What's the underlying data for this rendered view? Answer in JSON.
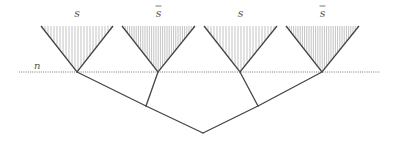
{
  "diagram": {
    "level_label": "n",
    "colors": {
      "edge": "#444444",
      "hatch": "#9a9a9a",
      "dotted": "#777777",
      "label": "#555555"
    },
    "cones": [
      {
        "label": "s",
        "bar": false,
        "apex": [
          77,
          72
        ],
        "left": [
          41,
          26
        ],
        "right": [
          113,
          26
        ]
      },
      {
        "label": "s",
        "bar": true,
        "apex": [
          158,
          72
        ],
        "left": [
          122,
          26
        ],
        "right": [
          195,
          26
        ]
      },
      {
        "label": "s",
        "bar": false,
        "apex": [
          240,
          72
        ],
        "left": [
          204,
          26
        ],
        "right": [
          277,
          26
        ]
      },
      {
        "label": "s",
        "bar": true,
        "apex": [
          322,
          72
        ],
        "left": [
          286,
          26
        ],
        "right": [
          359,
          26
        ]
      }
    ],
    "tree": {
      "root": [
        203,
        133
      ],
      "inner_left": [
        146,
        106
      ],
      "inner_right": [
        258,
        106
      ]
    },
    "level_line": {
      "y": 72,
      "x1": 19,
      "x2": 380
    }
  }
}
